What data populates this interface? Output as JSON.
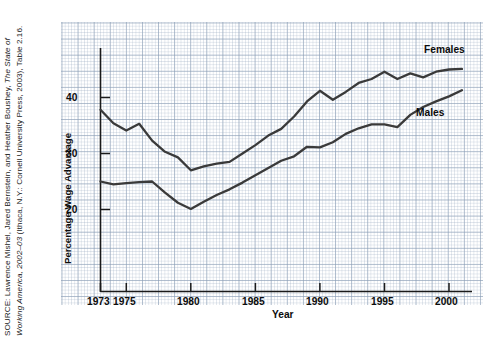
{
  "figure": {
    "source_note_prefix": "SOURCE: Lawrence Mishel, Jared Bernstein, and Heather Boushey, ",
    "source_note_italic": "The State of Working America, 2002–03",
    "source_note_suffix": " (Ithaca, N.Y.: Cornell University Press, 2003), Table 2.16.",
    "source_note_full": "SOURCE: Lawrence Mishel, Jared Bernstein, and Heather Boushey, The State of Working America, 2002–03 (Ithaca, N.Y.: Cornell University Press, 2003), Table 2.16."
  },
  "chart_data": {
    "type": "line",
    "title": "",
    "xlabel": "Year",
    "ylabel": "Percentage Wage Advantage",
    "xlim": [
      1973,
      2001
    ],
    "ylim": [
      12,
      48
    ],
    "xticks": [
      1973,
      1975,
      1980,
      1985,
      1990,
      1995,
      2000
    ],
    "xtick_labels": [
      "1973",
      "1975",
      "1980",
      "1985",
      "1990",
      "1995",
      "2000"
    ],
    "yticks": [
      20,
      30,
      40
    ],
    "ytick_labels": [
      "20",
      "30",
      "40"
    ],
    "grid": true,
    "grid_style": "graph-paper",
    "legend_position": "inline-right-of-line-ends",
    "line_color": "#3a3a3a",
    "x": [
      1973,
      1974,
      1975,
      1976,
      1977,
      1978,
      1979,
      1980,
      1981,
      1982,
      1983,
      1984,
      1985,
      1986,
      1987,
      1988,
      1989,
      1990,
      1991,
      1992,
      1993,
      1994,
      1995,
      1996,
      1997,
      1998,
      1999,
      2000,
      2001
    ],
    "series": [
      {
        "name": "Females",
        "label": "Females",
        "color": "#3a3a3a",
        "values": [
          37.8,
          35.4,
          34.1,
          35.3,
          32.3,
          30.3,
          29.3,
          27.0,
          27.7,
          28.2,
          28.5,
          30.0,
          31.5,
          33.2,
          34.4,
          36.6,
          39.3,
          41.2,
          39.6,
          41.0,
          42.6,
          43.3,
          44.6,
          43.3,
          44.3,
          43.6,
          44.6,
          45.0,
          45.1
        ]
      },
      {
        "name": "Males",
        "label": "Males",
        "color": "#3a3a3a",
        "values": [
          25.0,
          24.5,
          24.7,
          24.9,
          25.0,
          23.0,
          21.2,
          20.1,
          21.4,
          22.6,
          23.6,
          24.8,
          26.1,
          27.4,
          28.7,
          29.5,
          31.2,
          31.1,
          32.0,
          33.5,
          34.5,
          35.2,
          35.2,
          34.7,
          36.9,
          38.3,
          39.3,
          40.2,
          41.3
        ]
      }
    ]
  }
}
